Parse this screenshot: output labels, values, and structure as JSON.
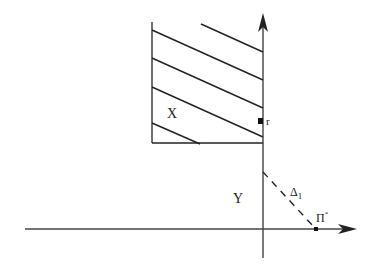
{
  "diagram": {
    "type": "region-diagram",
    "labels": {
      "region_x": "X",
      "region_y": "Y",
      "point_r": "r",
      "line_delta": "Δ",
      "line_delta_sub": "1",
      "point_pi": "Π",
      "point_pi_sup": "*"
    },
    "colors": {
      "stroke": "#222222",
      "axis": "#444444",
      "background": "#ffffff"
    },
    "elements": {
      "vertical_axis": {
        "x": 263,
        "y_top": 15,
        "y_bottom": 258
      },
      "horizontal_axis": {
        "y": 229,
        "x_left": 25,
        "x_right": 355
      },
      "hatched_region": {
        "x_left": 152,
        "x_right": 263,
        "y_top": 22,
        "y_bottom": 143
      },
      "point_r": {
        "x": 260,
        "y": 121
      },
      "point_pi_star": {
        "x": 316,
        "y": 229
      },
      "dashed_line": {
        "x1": 263,
        "y1": 172,
        "x2": 316,
        "y2": 229
      }
    }
  }
}
